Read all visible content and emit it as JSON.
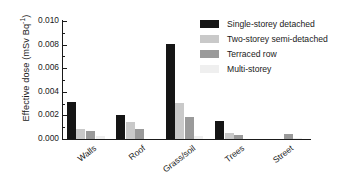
{
  "chart_data": {
    "type": "bar",
    "title": "",
    "xlabel": "",
    "ylabel": "Effective dose (mSv Bq",
    "ylabel_sup": "-1",
    "ylabel_suffix": ")",
    "ylim": [
      0.0,
      0.01
    ],
    "ytick_labels": [
      "0.010",
      "0.008",
      "0.006",
      "0.004",
      "0.002",
      "0.000"
    ],
    "ytick_values": [
      0.01,
      0.008,
      0.006,
      0.004,
      0.002,
      0.0
    ],
    "minor_tick_values": [
      0.009,
      0.007,
      0.005,
      0.003,
      0.001
    ],
    "grid": false,
    "legend_position": "top-right",
    "categories": [
      "Walls",
      "Roof",
      "Grass/soil",
      "Trees",
      "Street"
    ],
    "series": [
      {
        "name": "Single-storey detached",
        "color": "#151515",
        "values": [
          0.0031,
          0.00202,
          0.00805,
          0.00152,
          0.0
        ]
      },
      {
        "name": "Two-storey semi-detached",
        "color": "#c9c9c9",
        "values": [
          0.00082,
          0.00142,
          0.00305,
          0.00048,
          0.0
        ]
      },
      {
        "name": "Terraced row",
        "color": "#9a9a9a",
        "values": [
          0.00067,
          0.00086,
          0.00184,
          0.00038,
          0.0004
        ]
      },
      {
        "name": "Multi-storey",
        "color": "#efefef",
        "values": [
          0.00022,
          0.0,
          0.00028,
          0.0,
          0.00012
        ]
      }
    ]
  },
  "legend": {
    "items": [
      {
        "label": "Single-storey detached",
        "color": "#151515"
      },
      {
        "label": "Two-storey semi-detached",
        "color": "#c9c9c9"
      },
      {
        "label": "Terraced row",
        "color": "#9a9a9a"
      },
      {
        "label": "Multi-storey",
        "color": "#efefef"
      }
    ]
  },
  "axis": {
    "y_title_main": "Effective dose (mSv Bq",
    "y_title_sup": "-1",
    "y_title_end": ")"
  }
}
